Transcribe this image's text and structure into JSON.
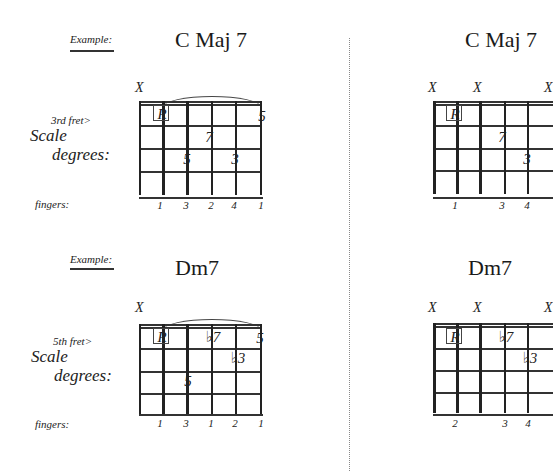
{
  "left_panel": {
    "examples": [
      {
        "example_label": "Example:",
        "chord_name": "C Maj 7",
        "fret_label": "3rd fret>",
        "scale_label_line1": "Scale",
        "scale_label_line2": "degrees:",
        "fingers_label": "fingers:",
        "muted_strings": [
          "X"
        ],
        "degrees": [
          {
            "string": 2,
            "fret": 1,
            "label": "R",
            "boxed": true
          },
          {
            "string": 6,
            "fret": 1,
            "label": "5"
          },
          {
            "string": 4,
            "fret": 2,
            "label": "7"
          },
          {
            "string": 3,
            "fret": 3,
            "label": "5"
          },
          {
            "string": 5,
            "fret": 3,
            "label": "3"
          }
        ],
        "fingers": [
          "1",
          "3",
          "2",
          "4",
          "1"
        ]
      },
      {
        "example_label": "Example:",
        "chord_name": "Dm7",
        "fret_label": "5th fret>",
        "scale_label_line1": "Scale",
        "scale_label_line2": "degrees:",
        "fingers_label": "fingers:",
        "muted_strings": [
          "X"
        ],
        "degrees": [
          {
            "string": 2,
            "fret": 1,
            "label": "R",
            "boxed": true
          },
          {
            "string": 4,
            "fret": 1,
            "label": "♭7"
          },
          {
            "string": 6,
            "fret": 1,
            "label": "5"
          },
          {
            "string": 5,
            "fret": 2,
            "label": "♭3"
          },
          {
            "string": 3,
            "fret": 3,
            "label": "5"
          }
        ],
        "fingers": [
          "1",
          "3",
          "1",
          "2",
          "1"
        ]
      }
    ]
  },
  "right_panel": {
    "examples": [
      {
        "chord_name": "C Maj 7",
        "muted_strings": [
          "X",
          "X"
        ],
        "degrees": [
          {
            "string": 2,
            "fret": 1,
            "label": "R",
            "boxed": true
          },
          {
            "string": 4,
            "fret": 2,
            "label": "7"
          },
          {
            "string": 5,
            "fret": 3,
            "label": "3"
          }
        ],
        "fingers": [
          "1",
          "3",
          "4"
        ]
      },
      {
        "chord_name": "Dm7",
        "muted_strings": [
          "X",
          "X"
        ],
        "degrees": [
          {
            "string": 2,
            "fret": 1,
            "label": "R",
            "boxed": true
          },
          {
            "string": 4,
            "fret": 1,
            "label": "♭7"
          },
          {
            "string": 5,
            "fret": 2,
            "label": "♭3"
          }
        ],
        "fingers": [
          "2",
          "3",
          "4"
        ]
      }
    ]
  }
}
